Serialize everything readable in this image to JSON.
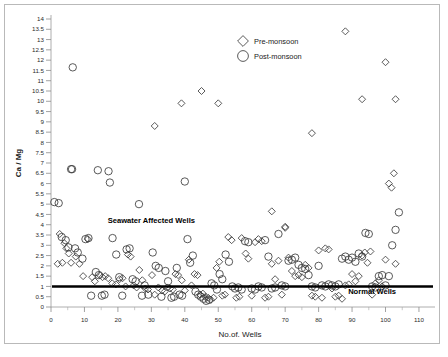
{
  "chart_data": {
    "type": "scatter",
    "title": "",
    "xlabel": "No.of. Wells",
    "ylabel": "Ca / Mg",
    "xlim": [
      0,
      113
    ],
    "ylim": [
      0,
      14
    ],
    "xticks": [
      0,
      10,
      20,
      30,
      40,
      50,
      60,
      70,
      80,
      90,
      100,
      110
    ],
    "yticks": [
      0,
      0.5,
      1,
      1.5,
      2,
      2.5,
      3,
      3.5,
      4,
      4.5,
      5,
      5.5,
      6,
      6.5,
      7,
      7.5,
      8,
      8.5,
      9,
      9.5,
      10,
      10.5,
      11,
      11.5,
      12,
      12.5,
      13,
      13.5,
      14
    ],
    "ytick_labels": [
      "0",
      "0.5",
      "1",
      "1.5",
      "2",
      "2.5",
      "3",
      "3.5",
      "4",
      "4.5",
      "5",
      "5.5",
      "6",
      "6.5",
      "7",
      "7.5",
      "8",
      "8.5",
      "9",
      "9.5",
      "10",
      "10.5",
      "11",
      "11.5",
      "12",
      "12.5",
      "13",
      "13.5",
      "14"
    ],
    "grid": false,
    "legend_position": "top-center",
    "annotations": [
      {
        "text": "Seawater Affected Wells",
        "x": 30,
        "y": 4.1
      },
      {
        "text": "Normal  Wells",
        "x": 96,
        "y": 0.62
      }
    ],
    "reference_line": {
      "orientation": "horizontal",
      "y": 1,
      "color": "#000000",
      "width": 2.4
    },
    "series": [
      {
        "name": "Pre-monsoon",
        "marker": "diamond",
        "color": "#3c3c3c",
        "points": [
          [
            2.0,
            2.1
          ],
          [
            2.6,
            3.55
          ],
          [
            3.4,
            2.15
          ],
          [
            4.0,
            3.1
          ],
          [
            4.6,
            2.85
          ],
          [
            5.3,
            2.6
          ],
          [
            6.0,
            2.15
          ],
          [
            7.4,
            2.45
          ],
          [
            8.5,
            2.1
          ],
          [
            9.6,
            1.5
          ],
          [
            11.0,
            3.3
          ],
          [
            12.3,
            1.45
          ],
          [
            13.1,
            1.25
          ],
          [
            14.6,
            1.55
          ],
          [
            15.4,
            1.45
          ],
          [
            16.2,
            1.5
          ],
          [
            17.1,
            1.4
          ],
          [
            18.3,
            1.15
          ],
          [
            19.4,
            1.1
          ],
          [
            20.5,
            1.35
          ],
          [
            21.4,
            1.4
          ],
          [
            22.3,
            1.0
          ],
          [
            23.0,
            2.55
          ],
          [
            23.8,
            2.45
          ],
          [
            24.7,
            1.05
          ],
          [
            25.6,
            0.95
          ],
          [
            26.4,
            1.8
          ],
          [
            27.3,
            1.3
          ],
          [
            28.2,
            0.9
          ],
          [
            29.0,
            0.85
          ],
          [
            30.2,
            1.55
          ],
          [
            31.0,
            0.6
          ],
          [
            32.1,
            0.95
          ],
          [
            33.2,
            0.8
          ],
          [
            34.0,
            0.75
          ],
          [
            34.8,
            0.95
          ],
          [
            35.6,
            0.9
          ],
          [
            36.4,
            0.85
          ],
          [
            37.2,
            1.6
          ],
          [
            38.0,
            1.55
          ],
          [
            39.1,
            1.3
          ],
          [
            40.0,
            0.8
          ],
          [
            41.2,
            2.3
          ],
          [
            42.0,
            1.05
          ],
          [
            42.9,
            1.6
          ],
          [
            43.8,
            1.55
          ],
          [
            44.6,
            0.6
          ],
          [
            45.4,
            0.65
          ],
          [
            46.2,
            0.5
          ],
          [
            47.0,
            0.45
          ],
          [
            47.8,
            0.35
          ],
          [
            48.6,
            0.45
          ],
          [
            49.5,
            1.9
          ],
          [
            50.3,
            2.2
          ],
          [
            51.2,
            0.55
          ],
          [
            52.0,
            0.6
          ],
          [
            53.0,
            3.4
          ],
          [
            54.0,
            3.25
          ],
          [
            55.4,
            0.45
          ],
          [
            56.3,
            0.5
          ],
          [
            57.0,
            3.35
          ],
          [
            58.2,
            2.6
          ],
          [
            59.0,
            2.35
          ],
          [
            60.0,
            0.55
          ],
          [
            61.0,
            3.15
          ],
          [
            62.0,
            3.3
          ],
          [
            63.0,
            3.2
          ],
          [
            64.0,
            0.45
          ],
          [
            65.0,
            0.5
          ],
          [
            66.0,
            2.1
          ],
          [
            67.0,
            1.35
          ],
          [
            68.0,
            2.25
          ],
          [
            69.0,
            0.6
          ],
          [
            70.0,
            3.85
          ],
          [
            71.0,
            2.4
          ],
          [
            72.0,
            1.75
          ],
          [
            73.0,
            1.5
          ],
          [
            74.0,
            1.55
          ],
          [
            75.0,
            1.45
          ],
          [
            76.0,
            2.05
          ],
          [
            77.0,
            1.9
          ],
          [
            78.0,
            0.55
          ],
          [
            79.0,
            0.5
          ],
          [
            80.0,
            2.75
          ],
          [
            81.0,
            0.45
          ],
          [
            82.0,
            2.85
          ],
          [
            83.0,
            2.8
          ],
          [
            84.0,
            0.9
          ],
          [
            85.0,
            0.5
          ],
          [
            86.0,
            0.55
          ],
          [
            87.0,
            0.4
          ],
          [
            88.0,
            1.05
          ],
          [
            89.0,
            1.1
          ],
          [
            90.0,
            1.6
          ],
          [
            91.0,
            1.25
          ],
          [
            92.0,
            1.5
          ],
          [
            93.0,
            2.5
          ],
          [
            93.8,
            2.65
          ],
          [
            94.6,
            2.15
          ],
          [
            95.5,
            2.7
          ],
          [
            96.0,
            0.6
          ],
          [
            97.0,
            1.15
          ],
          [
            98.0,
            1.3
          ],
          [
            99.0,
            1.0
          ],
          [
            100.0,
            2.3
          ],
          [
            101.0,
            6.0
          ],
          [
            101.8,
            5.8
          ],
          [
            102.5,
            6.5
          ],
          [
            103.0,
            2.1
          ],
          [
            88.0,
            13.4
          ],
          [
            100.0,
            11.9
          ],
          [
            93.0,
            10.1
          ],
          [
            103.0,
            10.1
          ],
          [
            78.0,
            8.45
          ],
          [
            45.0,
            10.5
          ],
          [
            50.0,
            9.9
          ],
          [
            39.0,
            9.9
          ],
          [
            31.0,
            8.8
          ],
          [
            66.0,
            4.65
          ],
          [
            70.0,
            3.9
          ]
        ]
      },
      {
        "name": "Post-monsoon",
        "marker": "circle",
        "color": "#3c3c3c",
        "points": [
          [
            1.0,
            5.1
          ],
          [
            2.3,
            5.05
          ],
          [
            3.2,
            3.4
          ],
          [
            4.4,
            3.25
          ],
          [
            5.2,
            2.9
          ],
          [
            6.3,
            6.7
          ],
          [
            7.2,
            2.85
          ],
          [
            8.0,
            2.65
          ],
          [
            9.4,
            2.35
          ],
          [
            10.3,
            3.3
          ],
          [
            11.2,
            3.35
          ],
          [
            12.0,
            0.55
          ],
          [
            13.4,
            1.7
          ],
          [
            14.3,
            1.55
          ],
          [
            15.2,
            0.55
          ],
          [
            16.0,
            0.6
          ],
          [
            17.2,
            6.6
          ],
          [
            17.6,
            6.05
          ],
          [
            18.4,
            3.35
          ],
          [
            19.5,
            2.55
          ],
          [
            20.4,
            1.45
          ],
          [
            21.3,
            0.55
          ],
          [
            22.6,
            2.8
          ],
          [
            23.5,
            2.85
          ],
          [
            24.4,
            1.35
          ],
          [
            25.3,
            1.25
          ],
          [
            26.3,
            5.0
          ],
          [
            27.2,
            0.55
          ],
          [
            28.0,
            1.05
          ],
          [
            29.1,
            0.6
          ],
          [
            30.4,
            2.65
          ],
          [
            31.3,
            2.0
          ],
          [
            32.2,
            1.9
          ],
          [
            33.0,
            0.5
          ],
          [
            34.2,
            1.75
          ],
          [
            35.0,
            1.25
          ],
          [
            36.0,
            0.45
          ],
          [
            36.8,
            0.5
          ],
          [
            37.6,
            1.9
          ],
          [
            38.4,
            0.6
          ],
          [
            39.2,
            0.55
          ],
          [
            40.0,
            6.1
          ],
          [
            40.8,
            3.3
          ],
          [
            41.6,
            2.15
          ],
          [
            42.4,
            2.5
          ],
          [
            43.2,
            0.75
          ],
          [
            44.0,
            0.6
          ],
          [
            44.8,
            0.5
          ],
          [
            45.6,
            0.4
          ],
          [
            46.4,
            0.3
          ],
          [
            47.2,
            0.35
          ],
          [
            48.0,
            1.15
          ],
          [
            48.8,
            1.05
          ],
          [
            49.6,
            0.85
          ],
          [
            50.4,
            1.6
          ],
          [
            51.2,
            1.35
          ],
          [
            52.2,
            2.55
          ],
          [
            53.2,
            2.2
          ],
          [
            54.2,
            1.0
          ],
          [
            55.0,
            0.9
          ],
          [
            56.0,
            0.95
          ],
          [
            57.0,
            0.85
          ],
          [
            58.0,
            3.2
          ],
          [
            59.0,
            3.15
          ],
          [
            60.0,
            0.9
          ],
          [
            61.0,
            0.85
          ],
          [
            62.0,
            1.0
          ],
          [
            63.0,
            0.95
          ],
          [
            64.0,
            3.25
          ],
          [
            65.0,
            2.45
          ],
          [
            66.0,
            0.9
          ],
          [
            67.0,
            0.95
          ],
          [
            68.0,
            3.55
          ],
          [
            69.0,
            1.05
          ],
          [
            70.0,
            1.0
          ],
          [
            71.0,
            2.25
          ],
          [
            72.0,
            2.3
          ],
          [
            73.0,
            2.4
          ],
          [
            74.0,
            2.05
          ],
          [
            75.0,
            1.9
          ],
          [
            76.0,
            1.85
          ],
          [
            77.0,
            1.55
          ],
          [
            78.0,
            1.0
          ],
          [
            79.0,
            0.95
          ],
          [
            80.0,
            2.0
          ],
          [
            81.0,
            1.05
          ],
          [
            82.0,
            1.0
          ],
          [
            83.0,
            1.1
          ],
          [
            84.0,
            1.05
          ],
          [
            85.0,
            1.0
          ],
          [
            86.0,
            1.1
          ],
          [
            87.0,
            2.35
          ],
          [
            88.0,
            2.45
          ],
          [
            89.0,
            2.3
          ],
          [
            90.0,
            2.4
          ],
          [
            91.0,
            2.2
          ],
          [
            92.0,
            2.6
          ],
          [
            93.0,
            2.45
          ],
          [
            94.0,
            3.6
          ],
          [
            95.0,
            3.55
          ],
          [
            96.0,
            1.0
          ],
          [
            97.0,
            0.95
          ],
          [
            98.0,
            1.5
          ],
          [
            99.0,
            1.55
          ],
          [
            100.0,
            1.05
          ],
          [
            101.0,
            1.5
          ],
          [
            102.0,
            3.0
          ],
          [
            103.0,
            3.75
          ],
          [
            104.0,
            4.6
          ],
          [
            6.5,
            11.65
          ],
          [
            6.0,
            6.7
          ],
          [
            14.0,
            6.65
          ]
        ]
      }
    ]
  },
  "legend": {
    "items": [
      {
        "label": "Pre-monsoon",
        "marker": "diamond"
      },
      {
        "label": "Post-monsoon",
        "marker": "circle"
      }
    ]
  }
}
